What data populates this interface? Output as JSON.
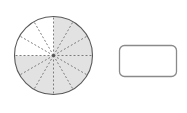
{
  "canvas": {
    "width": 187,
    "height": 113,
    "background_color": "#ffffff"
  },
  "figure": {
    "shapes": [
      {
        "name": "sectored-circle",
        "type": "circle",
        "cx": 53.5,
        "cy": 55.5,
        "r": 39.0,
        "stroke_color": "#5a5a5a",
        "stroke_width": 1.1,
        "sector_count": 12,
        "sector_angle_degrees": 30,
        "shaded_count": 9,
        "unshaded_count": 3,
        "shaded_fill": "#e2e2e2",
        "unshaded_fill": "#ffffff",
        "spoke_color": "#6e6e6e",
        "spoke_width": 0.9,
        "spoke_dash": "2,2",
        "center_dot_color": "#555555",
        "center_dot_r": 1.6,
        "sectors": [
          {
            "index": 0,
            "start_deg": -90,
            "end_deg": -60,
            "shaded": true
          },
          {
            "index": 1,
            "start_deg": -60,
            "end_deg": -30,
            "shaded": true
          },
          {
            "index": 2,
            "start_deg": -30,
            "end_deg": 0,
            "shaded": true
          },
          {
            "index": 3,
            "start_deg": 0,
            "end_deg": 30,
            "shaded": true
          },
          {
            "index": 4,
            "start_deg": 30,
            "end_deg": 60,
            "shaded": true
          },
          {
            "index": 5,
            "start_deg": 60,
            "end_deg": 90,
            "shaded": true
          },
          {
            "index": 6,
            "start_deg": 90,
            "end_deg": 120,
            "shaded": true
          },
          {
            "index": 7,
            "start_deg": 120,
            "end_deg": 150,
            "shaded": true
          },
          {
            "index": 8,
            "start_deg": 150,
            "end_deg": 180,
            "shaded": true
          },
          {
            "index": 9,
            "start_deg": 180,
            "end_deg": 210,
            "shaded": false
          },
          {
            "index": 10,
            "start_deg": 210,
            "end_deg": 240,
            "shaded": false
          },
          {
            "index": 11,
            "start_deg": 240,
            "end_deg": 270,
            "shaded": false
          }
        ]
      },
      {
        "name": "blank-rounded-rectangle",
        "type": "rounded-rect",
        "x": 119.5,
        "y": 45.5,
        "width": 57.0,
        "height": 31.0,
        "corner_radius": 5.0,
        "fill": "#ffffff",
        "stroke_color": "#8a8a8a",
        "stroke_width": 1.3
      }
    ]
  }
}
